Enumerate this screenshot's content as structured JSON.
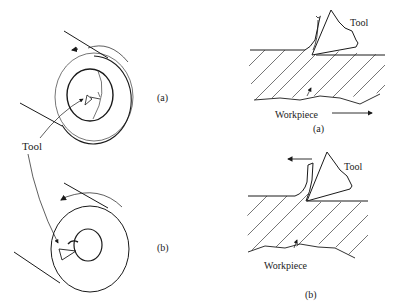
{
  "figure": {
    "left_panel": {
      "a": {
        "label": "(a)",
        "description": "Tool inside rotating cylindrical workpiece, boring"
      },
      "b": {
        "label": "(b)",
        "description": "Tool inside rotating cylindrical workpiece, small bore"
      },
      "tool_label": "Tool"
    },
    "right_panel": {
      "a": {
        "label": "(a)",
        "tool_label": "Tool",
        "workpiece_label": "Workpiece",
        "motion": "workpiece moves right"
      },
      "b": {
        "label": "(b)",
        "tool_label": "Tool",
        "workpiece_label": "Workpiece",
        "motion": "tool moves left"
      }
    }
  },
  "colors": {
    "line": "#1a1a1a",
    "background": "#ffffff"
  }
}
